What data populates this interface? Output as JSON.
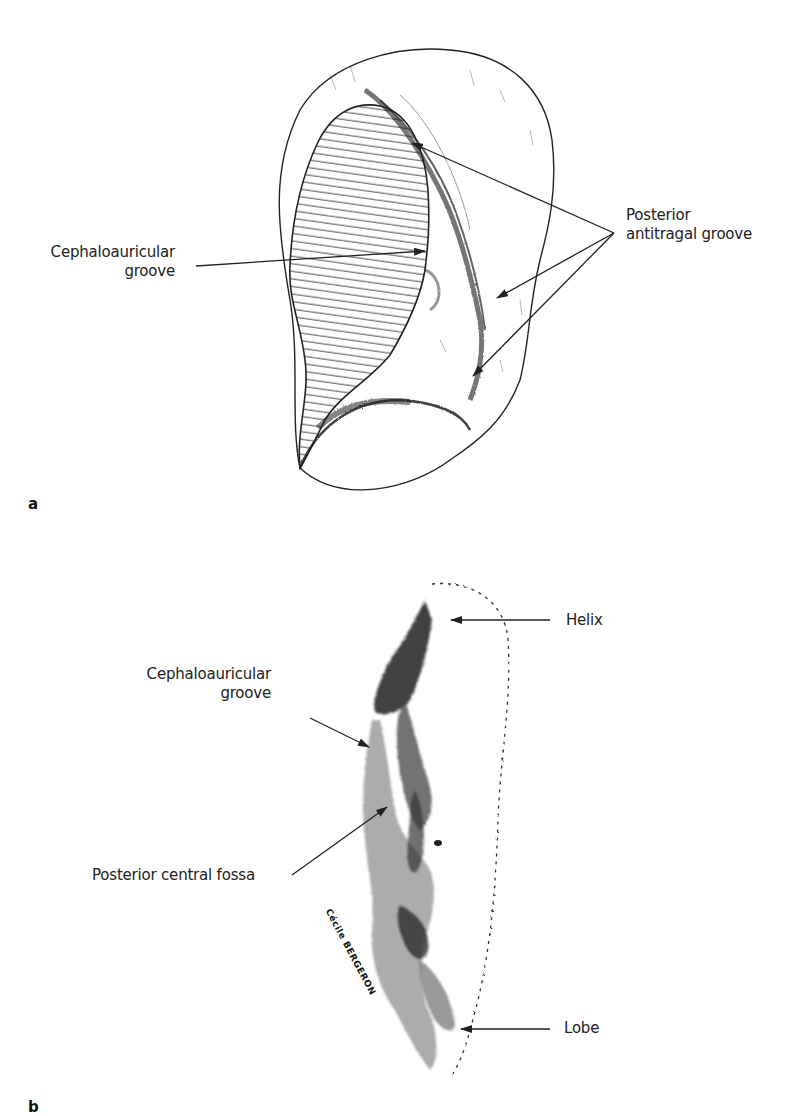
{
  "figure": {
    "panels": [
      {
        "letter": "a",
        "description": "Posterior view of auricle with hatched cephaloauricular area",
        "labels": {
          "cephaloauricular_line1": "Cephaloauricular",
          "cephaloauricular_line2": "groove",
          "antitragal_line1": "Posterior",
          "antitragal_line2": "antitragal groove"
        }
      },
      {
        "letter": "b",
        "description": "Lateral posterior view of auricle, pencil drawing",
        "labels": {
          "helix": "Helix",
          "cephaloauricular_line1": "Cephaloauricular",
          "cephaloauricular_line2": "groove",
          "posterior_central_fossa": "Posterior central fossa",
          "lobe": "Lobe"
        },
        "signature": "Cécile BERGERON"
      }
    ],
    "colors": {
      "ink": "#1e1e1e",
      "shade": "#555555",
      "background": "#ffffff"
    }
  }
}
